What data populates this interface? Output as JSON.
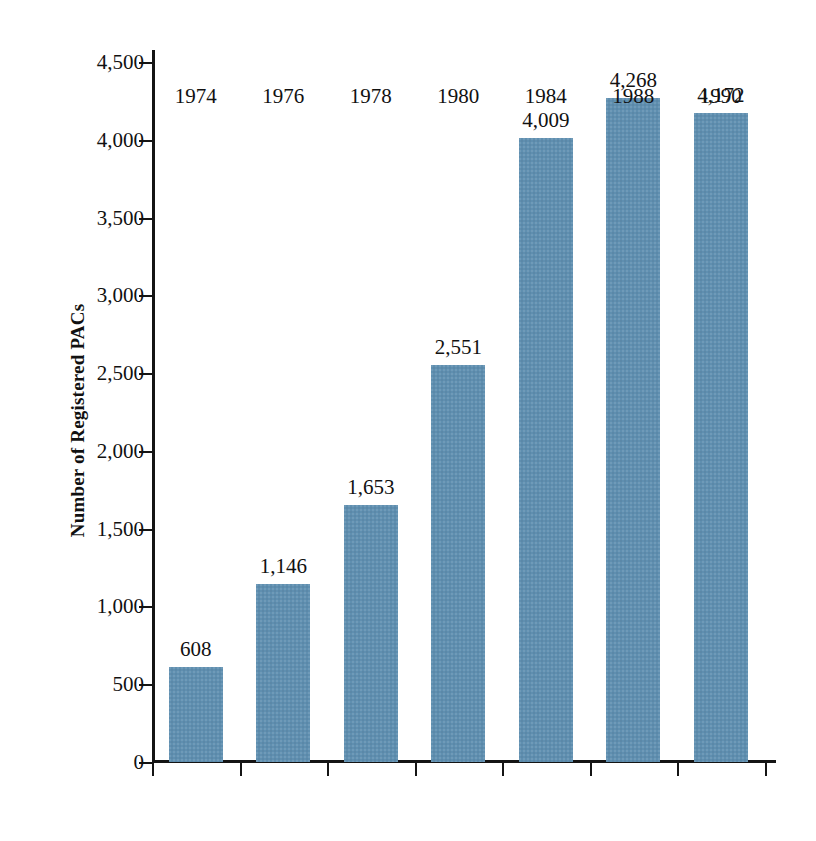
{
  "chart_data": {
    "type": "bar",
    "title": "",
    "xlabel": "",
    "ylabel": "Number of Registered PACs",
    "categories": [
      "1974",
      "1976",
      "1978",
      "1980",
      "1984",
      "1988",
      "1990"
    ],
    "values": [
      608,
      1146,
      1653,
      2551,
      4009,
      4268,
      4172
    ],
    "value_labels": [
      "608",
      "1,146",
      "1,653",
      "2,551",
      "4,009",
      "4,268",
      "4,172"
    ],
    "ylim": [
      0,
      4500
    ],
    "ytick_values": [
      0,
      500,
      1000,
      1500,
      2000,
      2500,
      3000,
      3500,
      4000,
      4500
    ],
    "ytick_labels": [
      "0",
      "500",
      "1,000",
      "1,500",
      "2,000",
      "2,500",
      "3,000",
      "3,500",
      "4,000",
      "4,500"
    ],
    "grid": false,
    "legend": false,
    "legend_position": "none",
    "bar_color": "#5f8fb0",
    "axis_color": "#141414",
    "text_color": "#111111"
  }
}
